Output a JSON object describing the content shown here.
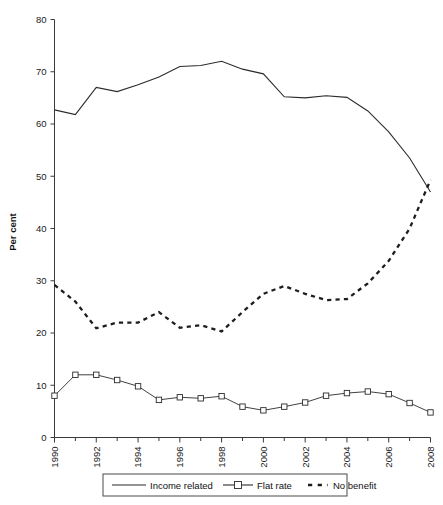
{
  "chart_data": {
    "type": "line",
    "title": "",
    "subtitle": "",
    "xlabel": "",
    "ylabel": "Per cent",
    "xlim": [
      1990,
      2008
    ],
    "ylim": [
      0,
      80
    ],
    "grid": false,
    "legend_position": "bottom",
    "y_ticks": [
      0,
      10,
      20,
      30,
      40,
      50,
      60,
      70,
      80
    ],
    "y_tick_labels": [
      "0",
      "10",
      "20",
      "30",
      "40",
      "50",
      "60",
      "70",
      "80"
    ],
    "x_ticks": [
      1990,
      1992,
      1994,
      1996,
      1998,
      2000,
      2002,
      2004,
      2006,
      2008
    ],
    "x_tick_labels": [
      "1990",
      "1992",
      "1994",
      "1996",
      "1998",
      "2000",
      "2002",
      "2004",
      "2006",
      "2008"
    ],
    "x": [
      1990,
      1991,
      1992,
      1993,
      1994,
      1995,
      1996,
      1997,
      1998,
      1999,
      2000,
      2001,
      2002,
      2003,
      2004,
      2005,
      2006,
      2007,
      2008
    ],
    "series": [
      {
        "name": "Income related",
        "style": "solid",
        "marker": "none",
        "color": "#2b2b2b",
        "values": [
          62.7,
          61.8,
          67.0,
          66.2,
          67.5,
          69.0,
          71.0,
          71.2,
          72.0,
          70.5,
          69.6,
          65.2,
          65.0,
          65.4,
          65.1,
          62.5,
          58.5,
          53.5,
          47.0
        ]
      },
      {
        "name": "Flat rate",
        "style": "solid",
        "marker": "open-square",
        "color": "#2b2b2b",
        "values": [
          8.0,
          12.0,
          12.0,
          11.0,
          9.8,
          7.2,
          7.7,
          7.5,
          7.9,
          5.9,
          5.2,
          5.9,
          6.7,
          8.0,
          8.5,
          8.8,
          8.3,
          6.6,
          4.8
        ]
      },
      {
        "name": "No benefit",
        "style": "dashed",
        "marker": "none",
        "color": "#1d1d1d",
        "values": [
          29.2,
          26.0,
          20.9,
          22.0,
          22.0,
          24.0,
          21.0,
          21.5,
          20.3,
          24.0,
          27.5,
          29.0,
          27.5,
          26.3,
          26.5,
          29.5,
          33.8,
          40.0,
          49.3
        ]
      }
    ]
  },
  "legend": {
    "entries": [
      {
        "label": "Income related",
        "swatch": "solid-line"
      },
      {
        "label": "Flat rate",
        "swatch": "line-with-square-marker"
      },
      {
        "label": "No benefit",
        "swatch": "dashed-line"
      }
    ]
  },
  "axis": {
    "y_title": "Per cent"
  }
}
